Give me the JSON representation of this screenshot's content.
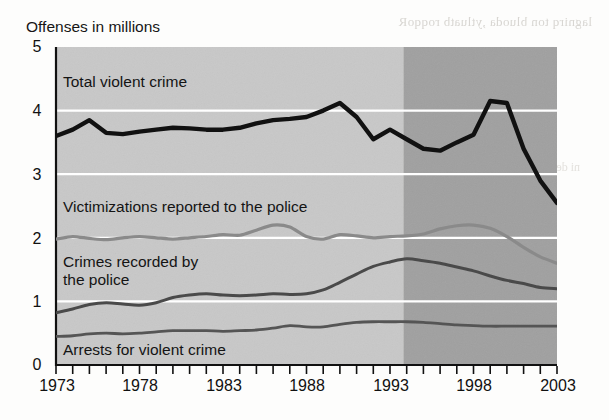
{
  "figure": {
    "axis_title": "Offenses in millions",
    "ghost_text": "lagnirq ton bluoda ,ytluatb roqqoR",
    "ghost_text2": "ni denil   eht  nosaer",
    "background": "#fdfdfc"
  },
  "colors": {
    "band_light": "#c8c8c8",
    "band_dark": "#a0a0a0",
    "gridline": "#ffffff",
    "total_violent_crime": "#111111",
    "victimizations_reported": "#8a8a8a",
    "crimes_recorded": "#4a4a4a",
    "arrests": "#555555",
    "text": "#111111"
  },
  "labels": {
    "total": "Total violent crime",
    "victimizations": "Victimizations reported to the police",
    "crimes_line1": "Crimes recorded by",
    "crimes_line2": "the police",
    "arrests": "Arrests for violent crime"
  },
  "chart_data": {
    "type": "line",
    "title": "Offenses in millions",
    "xlabel": "",
    "ylabel": "Offenses in millions",
    "xlim": [
      1973,
      2003
    ],
    "ylim": [
      0,
      5
    ],
    "yticks": [
      "0",
      "1",
      "2",
      "3",
      "4",
      "5"
    ],
    "xticks": [
      "1973",
      "1978",
      "1983",
      "1988",
      "1993",
      "1998",
      "2003"
    ],
    "xtick_all_years": [
      1973,
      1974,
      1975,
      1976,
      1977,
      1978,
      1979,
      1980,
      1981,
      1982,
      1983,
      1984,
      1985,
      1986,
      1987,
      1988,
      1989,
      1990,
      1991,
      1992,
      1993,
      1994,
      1995,
      1996,
      1997,
      1998,
      1999,
      2000,
      2001,
      2002,
      2003
    ],
    "grid": true,
    "grid_axis": "y",
    "legend": "inline-annotations",
    "shaded_bands": [
      {
        "name": "light-band",
        "x_from": 1973,
        "x_to": 1993.8,
        "color": "#c8c8c8"
      },
      {
        "name": "dark-band",
        "x_from": 1993.8,
        "x_to": 2003,
        "color": "#a0a0a0"
      }
    ],
    "x": [
      1973,
      1974,
      1975,
      1976,
      1977,
      1978,
      1979,
      1980,
      1981,
      1982,
      1983,
      1984,
      1985,
      1986,
      1987,
      1988,
      1989,
      1990,
      1991,
      1992,
      1993,
      1994,
      1995,
      1996,
      1997,
      1998,
      1999,
      2000,
      2001,
      2002,
      2003
    ],
    "series": [
      {
        "name": "Total violent crime",
        "color": "#111111",
        "values": [
          3.6,
          3.7,
          3.85,
          3.65,
          3.63,
          3.67,
          3.7,
          3.73,
          3.72,
          3.7,
          3.7,
          3.73,
          3.8,
          3.85,
          3.87,
          3.9,
          4.0,
          4.12,
          3.9,
          3.55,
          3.7,
          3.55,
          3.4,
          3.37,
          3.5,
          3.62,
          4.15,
          4.12,
          3.4,
          2.9,
          2.55
        ]
      },
      {
        "name": "Victimizations reported to the police",
        "color": "#8a8a8a",
        "values": [
          1.98,
          2.02,
          1.99,
          1.97,
          2.0,
          2.02,
          2.0,
          1.98,
          2.0,
          2.02,
          2.05,
          2.04,
          2.12,
          2.2,
          2.17,
          2.02,
          1.98,
          2.05,
          2.03,
          2.0,
          2.02,
          2.03,
          2.06,
          2.14,
          2.19,
          2.2,
          2.15,
          2.02,
          1.85,
          1.7,
          1.6
        ]
      },
      {
        "name": "Crimes recorded by the police",
        "color": "#4a4a4a",
        "values": [
          0.82,
          0.88,
          0.95,
          0.98,
          0.96,
          0.94,
          0.98,
          1.06,
          1.1,
          1.12,
          1.1,
          1.09,
          1.1,
          1.12,
          1.11,
          1.12,
          1.18,
          1.3,
          1.43,
          1.55,
          1.62,
          1.67,
          1.64,
          1.6,
          1.54,
          1.48,
          1.4,
          1.33,
          1.28,
          1.22,
          1.2
        ]
      },
      {
        "name": "Arrests for violent crime",
        "color": "#555555",
        "values": [
          0.45,
          0.46,
          0.49,
          0.5,
          0.49,
          0.5,
          0.52,
          0.54,
          0.54,
          0.54,
          0.53,
          0.54,
          0.55,
          0.58,
          0.62,
          0.6,
          0.6,
          0.64,
          0.67,
          0.68,
          0.68,
          0.68,
          0.67,
          0.65,
          0.63,
          0.62,
          0.61,
          0.61,
          0.61,
          0.61,
          0.61
        ]
      }
    ],
    "series_right_segments": {
      "total_after_1994": [
        4.15,
        4.12,
        3.9,
        3.55,
        3.12,
        2.8,
        2.45,
        2.15,
        1.95,
        1.82,
        1.78,
        1.88
      ],
      "note": "black line declines steeply after the 1994 peak of about 4.15 to about 1.85 in 2002, ticking up slightly at 2003"
    }
  }
}
